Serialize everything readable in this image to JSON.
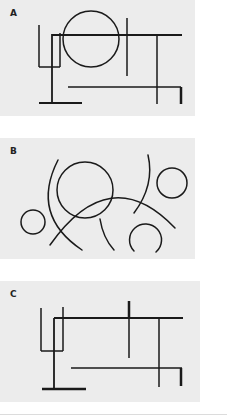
{
  "figure": {
    "panels": [
      {
        "label": "A",
        "description": "Rectilinear composition of straight line segments with one circle",
        "box": [
          0,
          0,
          195,
          116
        ],
        "lines": [
          {
            "x1": 39,
            "y1": 25,
            "x2": 39,
            "y2": 67,
            "w": 1.5
          },
          {
            "x1": 39,
            "y1": 67,
            "x2": 60,
            "y2": 67,
            "w": 1.5
          },
          {
            "x1": 60,
            "y1": 33,
            "x2": 60,
            "y2": 67,
            "w": 1.5
          },
          {
            "x1": 52,
            "y1": 34,
            "x2": 52,
            "y2": 103,
            "w": 1.8
          },
          {
            "x1": 39,
            "y1": 103,
            "x2": 82,
            "y2": 103,
            "w": 2.2
          },
          {
            "x1": 52,
            "y1": 35,
            "x2": 182,
            "y2": 35,
            "w": 2.2
          },
          {
            "x1": 127,
            "y1": 18,
            "x2": 127,
            "y2": 76,
            "w": 1.5
          },
          {
            "x1": 157,
            "y1": 36,
            "x2": 157,
            "y2": 104,
            "w": 1.5
          },
          {
            "x1": 68,
            "y1": 87,
            "x2": 181,
            "y2": 87,
            "w": 1.5
          },
          {
            "x1": 181,
            "y1": 87,
            "x2": 181,
            "y2": 104,
            "w": 2.5
          }
        ],
        "circles": [
          {
            "cx": 91,
            "cy": 39,
            "r": 28,
            "w": 1.5
          }
        ],
        "paths": []
      },
      {
        "label": "B",
        "description": "Composition of circles and curved arcs",
        "box": [
          0,
          138,
          195,
          121
        ],
        "lines": [],
        "circles": [
          {
            "cx": 33,
            "cy": 222,
            "r": 12,
            "w": 1.5
          },
          {
            "cx": 85,
            "cy": 190,
            "r": 28,
            "w": 1.5
          },
          {
            "cx": 172,
            "cy": 183,
            "r": 15,
            "w": 1.5
          }
        ],
        "paths": [
          {
            "d": "M58 160 Q 30 215 82 250",
            "w": 1.5
          },
          {
            "d": "M50 245 Q 110 160 175 228",
            "w": 1.5
          },
          {
            "d": "M100 219 Q 103 238 114 250",
            "w": 1.5
          },
          {
            "d": "M148 155 Q 155 185 134 213",
            "w": 1.5
          },
          {
            "d": "M134 251 A 16 16 0 1 1 156 252",
            "w": 1.5
          }
        ]
      },
      {
        "label": "C",
        "description": "Rectilinear composition of straight line segments, circle removed",
        "box": [
          0,
          281,
          200,
          121
        ],
        "lines": [
          {
            "x1": 41,
            "y1": 308,
            "x2": 41,
            "y2": 351,
            "w": 1.5
          },
          {
            "x1": 41,
            "y1": 351,
            "x2": 63,
            "y2": 351,
            "w": 1.5
          },
          {
            "x1": 63,
            "y1": 307,
            "x2": 63,
            "y2": 351,
            "w": 1.5
          },
          {
            "x1": 54,
            "y1": 318,
            "x2": 54,
            "y2": 389,
            "w": 1.8
          },
          {
            "x1": 42,
            "y1": 389,
            "x2": 86,
            "y2": 389,
            "w": 2.5
          },
          {
            "x1": 54,
            "y1": 318,
            "x2": 183,
            "y2": 318,
            "w": 2.2
          },
          {
            "x1": 129,
            "y1": 301,
            "x2": 129,
            "y2": 358,
            "w": 1.5
          },
          {
            "x1": 129,
            "y1": 301,
            "x2": 129,
            "y2": 318,
            "w": 2.5
          },
          {
            "x1": 159,
            "y1": 318,
            "x2": 159,
            "y2": 387,
            "w": 1.5
          },
          {
            "x1": 71,
            "y1": 368,
            "x2": 182,
            "y2": 368,
            "w": 1.5
          },
          {
            "x1": 181,
            "y1": 368,
            "x2": 181,
            "y2": 386,
            "w": 2.5
          }
        ],
        "circles": [],
        "paths": []
      }
    ],
    "colors": {
      "panel_background": "#ececec",
      "stroke": "#1a1a1a",
      "page_background": "#ffffff"
    }
  }
}
